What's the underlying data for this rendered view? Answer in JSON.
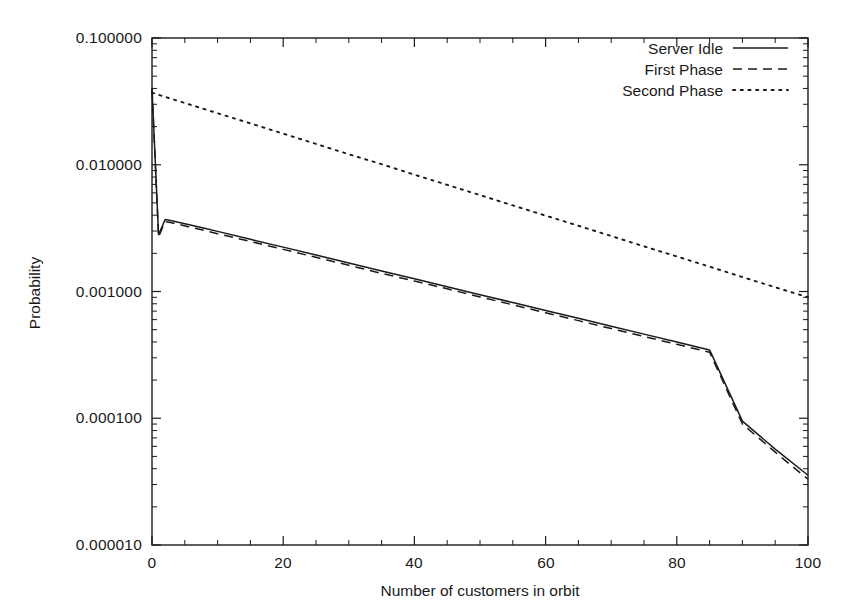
{
  "chart_data": {
    "type": "line",
    "title": "",
    "xlabel": "Number of customers in orbit",
    "ylabel": "Probability",
    "xlim": [
      0,
      100
    ],
    "ylim": [
      1e-05,
      0.1
    ],
    "yscale": "log",
    "xscale": "linear",
    "grid": false,
    "legend_position": "top-right inside",
    "xticks": [
      "0",
      "20",
      "40",
      "60",
      "80",
      "100"
    ],
    "xtick_values": [
      0,
      20,
      40,
      60,
      80,
      100
    ],
    "yticks": [
      "0.100000",
      "0.010000",
      "0.001000",
      "0.000100",
      "0.000010"
    ],
    "ytick_values": [
      0.1,
      0.01,
      0.001,
      0.0001,
      1e-05
    ],
    "series": [
      {
        "name": "Server Idle",
        "style": "solid",
        "x": [
          0,
          1,
          2,
          3,
          4,
          6,
          8,
          10,
          15,
          20,
          25,
          30,
          35,
          40,
          45,
          50,
          55,
          60,
          65,
          70,
          75,
          80,
          85,
          90,
          95,
          100
        ],
        "y": [
          0.04,
          0.0028,
          0.0037,
          0.00362,
          0.00352,
          0.00333,
          0.00315,
          0.00298,
          0.00258,
          0.00224,
          0.00194,
          0.00168,
          0.00145,
          0.00126,
          0.00109,
          0.000944,
          0.000818,
          0.000709,
          0.000614,
          0.000532,
          0.000461,
          0.000399,
          0.000346,
          9.5e-05,
          5.7e-05,
          3.55e-05
        ]
      },
      {
        "name": "First Phase",
        "style": "dashed",
        "x": [
          0,
          1,
          2,
          3,
          4,
          6,
          8,
          10,
          15,
          20,
          25,
          30,
          35,
          40,
          45,
          50,
          55,
          60,
          65,
          70,
          75,
          80,
          85,
          90,
          95,
          100
        ],
        "y": [
          0.0395,
          0.0027,
          0.00356,
          0.00348,
          0.00339,
          0.0032,
          0.00303,
          0.00286,
          0.00248,
          0.00215,
          0.00186,
          0.00161,
          0.00139,
          0.00121,
          0.00105,
          0.000906,
          0.000785,
          0.00068,
          0.000589,
          0.00051,
          0.000442,
          0.000383,
          0.000332,
          9e-05,
          5.4e-05,
          3.3e-05
        ]
      },
      {
        "name": "Second Phase",
        "style": "dotted",
        "x": [
          0,
          5,
          10,
          15,
          20,
          25,
          30,
          35,
          40,
          45,
          50,
          55,
          60,
          65,
          70,
          75,
          80,
          85,
          90,
          95,
          100
        ],
        "y": [
          0.037,
          0.0307,
          0.0255,
          0.0212,
          0.0176,
          0.0146,
          0.0121,
          0.0101,
          0.00835,
          0.00694,
          0.00576,
          0.00478,
          0.00397,
          0.0033,
          0.00274,
          0.00227,
          0.00189,
          0.00157,
          0.0013,
          0.00108,
          0.0009
        ]
      }
    ]
  },
  "legend": {
    "entries": [
      {
        "label": "Server Idle",
        "style": "solid"
      },
      {
        "label": "First Phase",
        "style": "dashed"
      },
      {
        "label": "Second Phase",
        "style": "dotted"
      }
    ]
  },
  "colors": {
    "axis": "#1a1a1a",
    "series": "#1a1a1a",
    "background": "#ffffff"
  }
}
